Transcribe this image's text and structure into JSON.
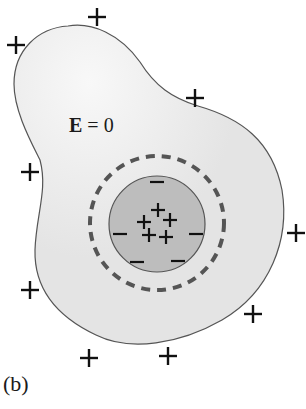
{
  "diagram": {
    "panel_label": "(b)",
    "field_label": {
      "symbol": "E",
      "equals": " = ",
      "value": "0"
    },
    "conductor": {
      "description": "irregular conductor",
      "fill": "#e6e6e6",
      "stroke": "#555555"
    },
    "cavity": {
      "fill": "#b9b9b9",
      "stroke": "#555555",
      "center": [
        157,
        224
      ],
      "radius": 48
    },
    "gaussian_surface": {
      "style": "dashed",
      "stroke": "#555555",
      "center": [
        157,
        223
      ],
      "radius": 67
    },
    "outer_surface_charges": {
      "sign": "+",
      "positions": [
        [
          97,
          17
        ],
        [
          16,
          45
        ],
        [
          195,
          98
        ],
        [
          30,
          172
        ],
        [
          296,
          233
        ],
        [
          30,
          290
        ],
        [
          253,
          314
        ],
        [
          89,
          358
        ],
        [
          168,
          356
        ]
      ]
    },
    "cavity_charges": {
      "sign": "+",
      "positions": [
        [
          158,
          210
        ],
        [
          144,
          222
        ],
        [
          170,
          220
        ],
        [
          149,
          235
        ],
        [
          166,
          237
        ]
      ]
    },
    "inner_surface_charges": {
      "sign": "−",
      "positions": [
        [
          157,
          182
        ],
        [
          120,
          234
        ],
        [
          196,
          234
        ],
        [
          137,
          262
        ],
        [
          178,
          261
        ]
      ]
    }
  }
}
